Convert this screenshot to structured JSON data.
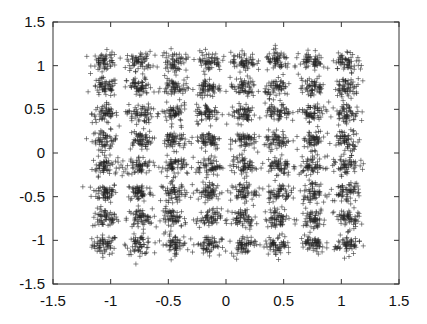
{
  "chart_data": {
    "type": "scatter",
    "title": "",
    "xlabel": "",
    "ylabel": "",
    "xlim": [
      -1.5,
      1.5
    ],
    "ylim": [
      -1.5,
      1.5
    ],
    "grid": false,
    "legend": null,
    "marker": "+",
    "marker_color": "#222222",
    "x_ticks": [
      "-1.5",
      "-1",
      "-0.5",
      "0",
      "0.5",
      "1",
      "1.5"
    ],
    "y_ticks": [
      "-1.5",
      "-1",
      "-0.5",
      "0",
      "0.5",
      "1",
      "1.5"
    ],
    "cluster_centers_x": [
      -1.05,
      -0.75,
      -0.45,
      -0.15,
      0.15,
      0.45,
      0.75,
      1.05
    ],
    "cluster_centers_y": [
      -1.05,
      -0.75,
      -0.45,
      -0.15,
      0.15,
      0.45,
      0.75,
      1.05
    ],
    "points_per_cluster": 60,
    "noise_std": 0.055
  }
}
